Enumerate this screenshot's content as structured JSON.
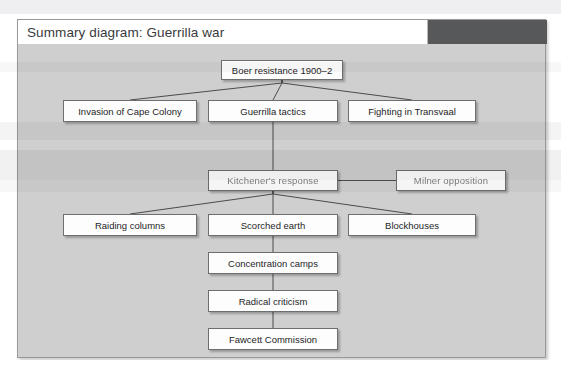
{
  "panel": {
    "title": "Summary diagram: Guerrilla war",
    "accent_dark": "#57585A",
    "background": "#CFCFD0",
    "box_fill": "#FDFDFD",
    "box_border": "#6D6E70"
  },
  "diagram": {
    "type": "flowchart",
    "root": "Boer resistance 1900–2",
    "nodes": [
      {
        "id": "boer",
        "label": "Boer resistance 1900–2",
        "x": 203,
        "y": 16,
        "w": 122,
        "h": 20,
        "faded": false
      },
      {
        "id": "invasion",
        "label": "Invasion of Cape Colony",
        "x": 45,
        "y": 56,
        "w": 134,
        "h": 22,
        "faded": false
      },
      {
        "id": "tactics",
        "label": "Guerrilla tactics",
        "x": 190,
        "y": 56,
        "w": 130,
        "h": 22,
        "faded": false
      },
      {
        "id": "transvaal",
        "label": "Fighting in Transvaal",
        "x": 330,
        "y": 56,
        "w": 128,
        "h": 22,
        "faded": false
      },
      {
        "id": "kitchener",
        "label": "Kitchener's response",
        "x": 190,
        "y": 126,
        "w": 130,
        "h": 21,
        "faded": true
      },
      {
        "id": "milner",
        "label": "Milner opposition",
        "x": 378,
        "y": 126,
        "w": 110,
        "h": 21,
        "faded": true
      },
      {
        "id": "raiding",
        "label": "Raiding columns",
        "x": 45,
        "y": 170,
        "w": 134,
        "h": 22,
        "faded": false
      },
      {
        "id": "scorched",
        "label": "Scorched earth",
        "x": 190,
        "y": 170,
        "w": 130,
        "h": 22,
        "faded": false
      },
      {
        "id": "blockhouses",
        "label": "Blockhouses",
        "x": 330,
        "y": 170,
        "w": 128,
        "h": 22,
        "faded": false
      },
      {
        "id": "camps",
        "label": "Concentration camps",
        "x": 190,
        "y": 208,
        "w": 130,
        "h": 22,
        "faded": false
      },
      {
        "id": "radical",
        "label": "Radical criticism",
        "x": 190,
        "y": 246,
        "w": 130,
        "h": 22,
        "faded": false
      },
      {
        "id": "fawcett",
        "label": "Fawcett Commission",
        "x": 190,
        "y": 284,
        "w": 130,
        "h": 22,
        "faded": false
      }
    ],
    "edges": [
      {
        "from": "boer",
        "to": "invasion"
      },
      {
        "from": "boer",
        "to": "tactics"
      },
      {
        "from": "boer",
        "to": "transvaal"
      },
      {
        "from": "tactics",
        "to": "kitchener"
      },
      {
        "from": "kitchener",
        "to": "milner"
      },
      {
        "from": "kitchener",
        "to": "raiding"
      },
      {
        "from": "kitchener",
        "to": "scorched"
      },
      {
        "from": "kitchener",
        "to": "blockhouses"
      },
      {
        "from": "scorched",
        "to": "camps"
      },
      {
        "from": "camps",
        "to": "radical"
      },
      {
        "from": "radical",
        "to": "fawcett"
      }
    ]
  }
}
